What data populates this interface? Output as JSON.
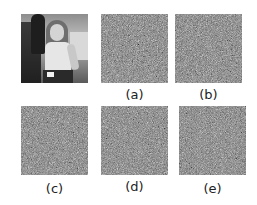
{
  "figure": {
    "panels": [
      {
        "id": "original",
        "label": "",
        "kind": "photo",
        "description": "grayscale photo of a woman in a tank top"
      },
      {
        "id": "a",
        "label": "(a)",
        "kind": "noise"
      },
      {
        "id": "b",
        "label": "(b)",
        "kind": "noise"
      },
      {
        "id": "c",
        "label": "(c)",
        "kind": "noise"
      },
      {
        "id": "d",
        "label": "(d)",
        "kind": "noise"
      },
      {
        "id": "e",
        "label": "(e)",
        "kind": "noise"
      }
    ],
    "colors": {
      "background": "#ffffff",
      "noise_mid_gray": "#777777",
      "label_text": "#222222"
    }
  }
}
